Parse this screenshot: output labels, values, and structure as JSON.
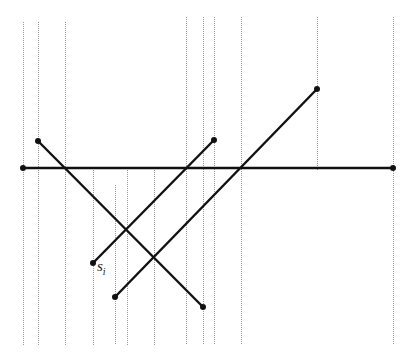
{
  "diagram": {
    "title": "",
    "colors": {
      "segment": "#111111",
      "sweep_line": "#999999",
      "background": "#ffffff"
    },
    "sweep_lines_x": [
      23,
      38,
      65,
      93,
      115,
      127,
      154,
      186,
      203,
      214,
      241,
      317,
      393
    ],
    "sweep_lines": [
      {
        "x": 23,
        "y1": 22,
        "y2": 345
      },
      {
        "x": 38,
        "y1": 22,
        "y2": 345
      },
      {
        "x": 65,
        "y1": 22,
        "y2": 345
      },
      {
        "x": 93,
        "y1": 168,
        "y2": 345
      },
      {
        "x": 115,
        "y1": 185,
        "y2": 345
      },
      {
        "x": 127,
        "y1": 168,
        "y2": 345
      },
      {
        "x": 154,
        "y1": 168,
        "y2": 345
      },
      {
        "x": 186,
        "y1": 17,
        "y2": 345
      },
      {
        "x": 203,
        "y1": 17,
        "y2": 345
      },
      {
        "x": 214,
        "y1": 17,
        "y2": 345
      },
      {
        "x": 241,
        "y1": 17,
        "y2": 345
      },
      {
        "x": 317,
        "y1": 17,
        "y2": 170
      },
      {
        "x": 393,
        "y1": 17,
        "y2": 345
      }
    ],
    "segments": [
      {
        "id": "horizontal",
        "x1": 23,
        "y1": 168,
        "x2": 393,
        "y2": 168
      },
      {
        "id": "a",
        "x1": 38,
        "y1": 141,
        "x2": 203,
        "y2": 307
      },
      {
        "id": "s_i",
        "x1": 93,
        "y1": 263,
        "x2": 214,
        "y2": 140
      },
      {
        "id": "b",
        "x1": 115,
        "y1": 297,
        "x2": 317,
        "y2": 89
      }
    ],
    "label": {
      "base": "s",
      "subscript": "i",
      "x": 97,
      "y": 258
    }
  }
}
